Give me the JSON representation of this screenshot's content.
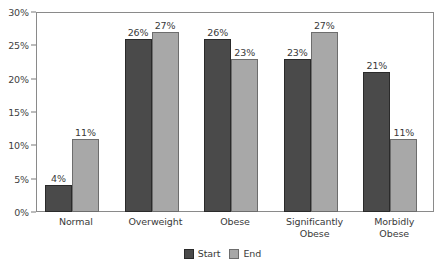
{
  "chart_data": {
    "type": "bar",
    "title": "",
    "subtitle": "",
    "xlabel": "",
    "ylabel": "",
    "categories": [
      "Normal",
      "Overweight",
      "Obese",
      "Significantly Obese",
      "Morbidly Obese"
    ],
    "series": [
      {
        "name": "Start",
        "color": "#4a4a4a",
        "values": [
          4,
          26,
          26,
          23,
          21
        ],
        "value_labels": [
          "4%",
          "26%",
          "26%",
          "23%",
          "21%"
        ]
      },
      {
        "name": "End",
        "color": "#a8a8a8",
        "values": [
          11,
          27,
          23,
          27,
          11
        ],
        "value_labels": [
          "11%",
          "27%",
          "23%",
          "27%",
          "11%"
        ]
      }
    ],
    "ylim": [
      0,
      30
    ],
    "y_tick_values": [
      0,
      5,
      10,
      15,
      20,
      25,
      30
    ],
    "y_tick_labels": [
      "0%",
      "5%",
      "10%",
      "15%",
      "20%",
      "25%",
      "30%"
    ],
    "grid": false,
    "legend_position": "bottom-center",
    "category_label_lines": [
      [
        "Normal"
      ],
      [
        "Overweight"
      ],
      [
        "Obese"
      ],
      [
        "Significantly",
        "Obese"
      ],
      [
        "Morbidly",
        "Obese"
      ]
    ]
  },
  "legend": {
    "items": [
      {
        "label": "Start",
        "swatch": "start-color-swatch"
      },
      {
        "label": "End",
        "swatch": "end-color-swatch"
      }
    ]
  }
}
